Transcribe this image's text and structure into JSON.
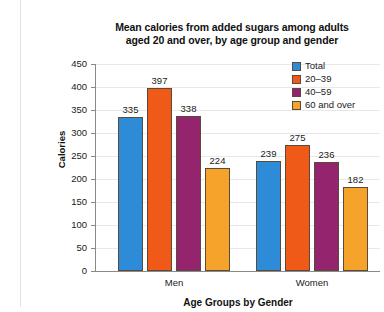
{
  "chart_data": {
    "type": "bar",
    "title": "Mean calories from added sugars among adults aged 20 and over, by age group and gender",
    "title_line1": "Mean calories from added sugars among adults",
    "title_line2": "aged 20 and over, by age group and gender",
    "xlabel": "Age Groups by Gender",
    "ylabel": "Calories",
    "categories": [
      "Men",
      "Women"
    ],
    "ylim": [
      0,
      450
    ],
    "yticks": [
      0,
      50,
      100,
      150,
      200,
      250,
      300,
      350,
      400,
      450
    ],
    "ytick_labels": [
      "0",
      "50",
      "100",
      "150",
      "200",
      "250",
      "300",
      "350",
      "400",
      "450"
    ],
    "grid": true,
    "legend_position": "top-right",
    "series": [
      {
        "name": "Total",
        "color": "#2e8bd8",
        "values": [
          335,
          239
        ],
        "labels": [
          "335",
          "239"
        ]
      },
      {
        "name": "20–39",
        "color": "#f05a19",
        "values": [
          397,
          275
        ],
        "labels": [
          "397",
          "275"
        ]
      },
      {
        "name": "40–59",
        "color": "#94246e",
        "values": [
          338,
          236
        ],
        "labels": [
          "338",
          "236"
        ]
      },
      {
        "name": "60 and over",
        "color": "#f5a32a",
        "values": [
          224,
          182
        ],
        "labels": [
          "224",
          "182"
        ]
      }
    ]
  },
  "legend": {
    "items": [
      {
        "label": "Total",
        "color": "#2e8bd8"
      },
      {
        "label": "20–39",
        "color": "#f05a19"
      },
      {
        "label": "40–59",
        "color": "#94246e"
      },
      {
        "label": "60 and over",
        "color": "#f5a32a"
      }
    ]
  }
}
